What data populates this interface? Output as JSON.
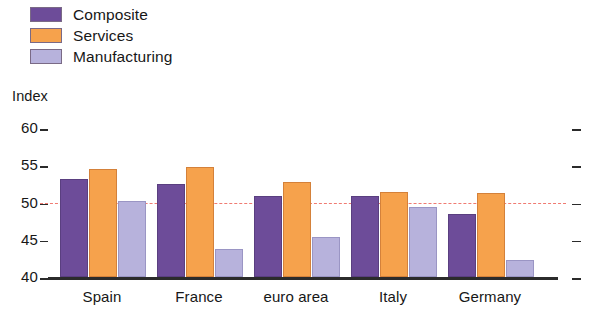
{
  "legend": {
    "items": [
      {
        "label": "Composite",
        "color": "#6d4c99",
        "key": "composite"
      },
      {
        "label": "Services",
        "color": "#f6a24c",
        "key": "services"
      },
      {
        "label": "Manufacturing",
        "color": "#b7b2dc",
        "key": "manufacturing"
      }
    ]
  },
  "axis": {
    "y_label": "Index",
    "y_ticks": [
      "60",
      "55",
      "50",
      "45",
      "40"
    ]
  },
  "chart_data": {
    "type": "bar",
    "title": "",
    "subtitle": "",
    "xlabel": "",
    "ylabel": "Index",
    "ylim": [
      40,
      60
    ],
    "yticks": [
      40,
      45,
      50,
      55,
      60
    ],
    "grid": false,
    "legend_position": "top-left",
    "categories": [
      "Spain",
      "France",
      "euro area",
      "Italy",
      "Germany"
    ],
    "series": [
      {
        "name": "Composite",
        "color": "#6d4c99",
        "values": [
          53.2,
          52.5,
          50.9,
          50.9,
          48.5
        ]
      },
      {
        "name": "Services",
        "color": "#f6a24c",
        "values": [
          54.5,
          54.7,
          52.7,
          51.4,
          51.3
        ]
      },
      {
        "name": "Manufacturing",
        "color": "#b7b2dc",
        "values": [
          50.2,
          43.8,
          45.4,
          49.4,
          42.3
        ]
      }
    ],
    "annotations": [
      {
        "type": "hline",
        "value": 50,
        "style": "dashed",
        "color": "#f07b72",
        "label": ""
      }
    ]
  }
}
